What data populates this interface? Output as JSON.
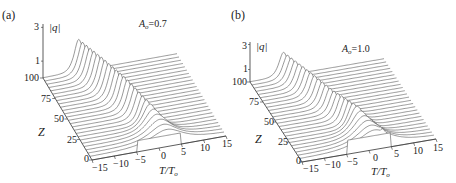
{
  "chart_data": [
    {
      "type": "surface-waterfall",
      "panel_label": "(a)",
      "annotation": {
        "symbol": "A",
        "subscript": "o",
        "value": "=0.7"
      },
      "zlabel": "|q|",
      "zlabel_var": "q",
      "zticks": [
        "3",
        "1"
      ],
      "ylabel": "Z",
      "yticks": [
        "100",
        "75",
        "50",
        "25",
        "0"
      ],
      "yrange": [
        0,
        100
      ],
      "xlabel_main": "T/T",
      "xlabel_sub": "o",
      "xticks": [
        "−15",
        "−10",
        "−5",
        "0",
        "5",
        "10",
        "15"
      ],
      "xrange": [
        -15,
        15
      ],
      "description": "Initial rectangular pulse (width ~10, height ~0.7) at Z=0 evolves into a single stable soliton peak (|q|≈2) that drifts toward negative T as Z increases to 100.",
      "series": [
        {
          "name": "peak position T/To vs Z",
          "x": [
            0,
            25,
            50,
            75,
            100
          ],
          "values": [
            2.5,
            0.5,
            -2.0,
            -4.5,
            -7.0
          ]
        },
        {
          "name": "peak |q| vs Z",
          "x": [
            0,
            25,
            50,
            75,
            100
          ],
          "values": [
            0.7,
            1.5,
            1.9,
            2.0,
            2.0
          ]
        }
      ]
    },
    {
      "type": "surface-waterfall",
      "panel_label": "(b)",
      "annotation": {
        "symbol": "A",
        "subscript": "o",
        "value": "=1.0"
      },
      "zlabel": "|q|",
      "zlabel_var": "q",
      "zticks": [
        "3",
        "1"
      ],
      "ylabel": "Z",
      "yticks": [
        "100",
        "75",
        "50",
        "25",
        "0"
      ],
      "yrange": [
        0,
        100
      ],
      "xlabel_main": "T/T",
      "xlabel_sub": "o",
      "xticks": [
        "−15",
        "−10",
        "−5",
        "0",
        "5",
        "10",
        "15"
      ],
      "xrange": [
        -15,
        15
      ],
      "description": "Initial rectangular pulse (height 1.0) breaks into multiple peaks at small Z; a dominant soliton emerges and drifts toward negative T while secondary peaks decay.",
      "series": [
        {
          "name": "main peak position T/To vs Z",
          "x": [
            0,
            25,
            50,
            75,
            100
          ],
          "values": [
            2.0,
            0.0,
            -2.5,
            -5.0,
            -7.5
          ]
        },
        {
          "name": "main peak |q| vs Z",
          "x": [
            0,
            25,
            50,
            75,
            100
          ],
          "values": [
            1.0,
            1.8,
            1.6,
            1.7,
            1.7
          ]
        },
        {
          "name": "secondary peak position T/To vs Z",
          "x": [
            0,
            25,
            50
          ],
          "values": [
            3.5,
            3.0,
            1.5
          ]
        }
      ]
    }
  ]
}
